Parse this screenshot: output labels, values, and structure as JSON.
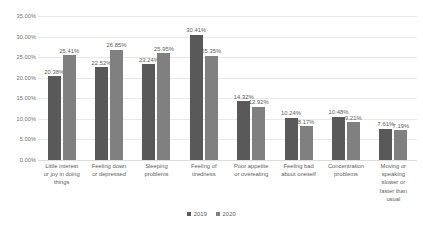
{
  "chart_data": {
    "type": "bar",
    "title": "",
    "subtitle": "",
    "xlabel": "",
    "ylabel": "",
    "ylim": [
      0,
      35
    ],
    "ytick_labels": [
      "35.00%",
      "30.00%",
      "25.00%",
      "20.00%",
      "15.00%",
      "10.00%",
      "5.00%",
      "0.00%"
    ],
    "ytick_values": [
      35,
      30,
      25,
      20,
      15,
      10,
      5,
      0
    ],
    "grid": true,
    "legend_position": "bottom",
    "value_suffix": "%",
    "categories": [
      "Little interest or joy in doing things",
      "Feeling down or depressed",
      "Sleeping problems",
      "Feeling of tiredness",
      "Poor appetite or overeating",
      "Feeling bad about oneself",
      "Concentration problems",
      "Moving or speaking slower or faster than usual"
    ],
    "category_lines": [
      [
        "Little interest",
        "or joy in doing",
        "things"
      ],
      [
        "Feeling down",
        "or depressed"
      ],
      [
        "Sleeping",
        "problems"
      ],
      [
        "Feeling of",
        "tiredness"
      ],
      [
        "Poor appetite",
        "or overeating"
      ],
      [
        "Feeling bad",
        "about oneself"
      ],
      [
        "Concentration",
        "problems"
      ],
      [
        "Moving or",
        "speaking",
        "slower or",
        "faster than",
        "usual"
      ]
    ],
    "series": [
      {
        "name": "2019",
        "color": "#595959",
        "values": [
          20.38,
          22.52,
          23.24,
          30.41,
          14.32,
          10.24,
          10.48,
          7.61
        ],
        "labels": [
          "20.38%",
          "22.52%",
          "23.24%",
          "30.41%",
          "14.32%",
          "10.24%",
          "10.48%",
          "7.61%"
        ]
      },
      {
        "name": "2020",
        "color": "#808080",
        "values": [
          25.41,
          26.85,
          25.95,
          25.35,
          12.92,
          8.17,
          9.21,
          7.19
        ],
        "labels": [
          "25.41%",
          "26.85%",
          "25.95%",
          "25.35%",
          "12.92%",
          "8.17%",
          "9.21%",
          "7.19%"
        ]
      }
    ]
  }
}
